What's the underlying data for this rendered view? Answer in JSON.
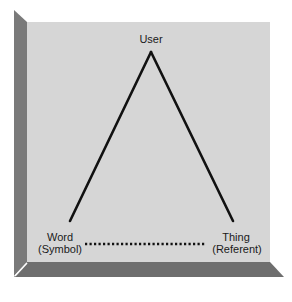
{
  "diagram": {
    "type": "semiotic-triangle",
    "colors": {
      "panel": "#d6d6d6",
      "bevel_left": "#7a7a7a",
      "bevel_bottom": "#6e6e6e",
      "bevel_highlight": "#ffffff",
      "line": "#111111"
    },
    "nodes": {
      "apex": {
        "label": "User"
      },
      "left": {
        "label": "Word",
        "sublabel": "(Symbol)"
      },
      "right": {
        "label": "Thing",
        "sublabel": "(Referent)"
      }
    },
    "edges": [
      {
        "from": "left",
        "to": "apex",
        "style": "solid"
      },
      {
        "from": "apex",
        "to": "right",
        "style": "solid"
      },
      {
        "from": "left",
        "to": "right",
        "style": "dotted"
      }
    ]
  }
}
